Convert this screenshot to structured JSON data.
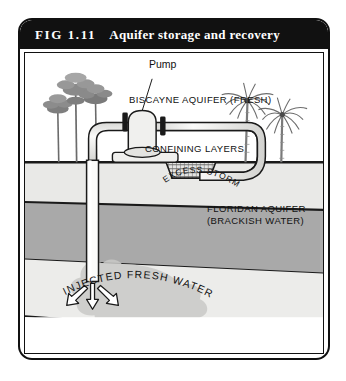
{
  "figure": {
    "number": "FIG 1.11",
    "title": "Aquifer storage and recovery"
  },
  "labels": {
    "pump": "Pump",
    "excess_storm_water": "EXCESS STORM WATER",
    "biscayne_aquifer": "BISCAYNE AQUIFER (FRESH)",
    "confining_layers": "CONFINING LAYERS",
    "injected_fresh_water": "INJECTED FRESH WATER",
    "floridan_aquifer_line1": "FLORIDAN AQUIFER",
    "floridan_aquifer_line2": "(BRACKISH WATER)"
  },
  "colors": {
    "title_bar": "#111111",
    "frame_border": "#111111",
    "surface_layer": "#ececea",
    "biscayne_layer": "#e8e8e6",
    "confining_layer": "#a8a8a8",
    "floridan_layer": "#ebebe9",
    "injection_plume": "#c9c9c7",
    "pipe_fill": "#f4f4f2",
    "pipe_outline": "#1a1a1a",
    "tree_canopy": "#8a8a8a",
    "palm_frond": "#6e6e6e"
  },
  "elements": {
    "pine_tree_count": 3,
    "palm_tree_count": 2,
    "injection_arrow_count": 3
  }
}
